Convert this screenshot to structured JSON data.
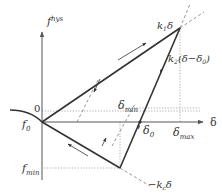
{
  "diagram": {
    "y_axis_label": "f",
    "y_axis_sup": "hys",
    "x_axis_label": "δ",
    "labels": {
      "zero": "0",
      "f0": "f",
      "f0_sub": "0",
      "fmin": "f",
      "fmin_sub": "min",
      "delta_min": "δ",
      "delta_min_sub": "min",
      "delta0": "δ",
      "delta0_sub": "0",
      "delta_max": "δ",
      "delta_max_sub": "max",
      "k1_line": "k",
      "k1_sub": "1",
      "k1_tail": "δ",
      "k2_line": "k",
      "k2_sub": "2",
      "k2_tail": "(δ−δ",
      "k2_tail_sub": "0",
      "k2_close": ")",
      "kc_line": "−k",
      "kc_sub": "c",
      "kc_tail": "δ"
    },
    "colors": {
      "axis": "#555555",
      "path": "#333333",
      "dashed": "#888888",
      "dotted": "#999999"
    }
  }
}
